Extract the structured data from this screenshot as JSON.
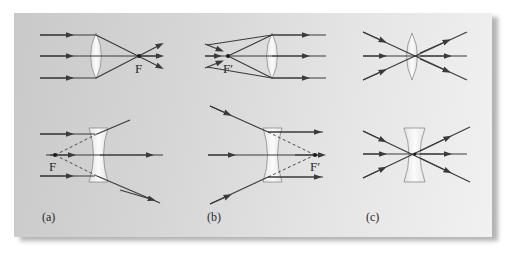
{
  "figure": {
    "colors": {
      "ray": "#3a3a3a",
      "lens_fill": "#f4f4f4",
      "lens_stroke": "#8a8a8a",
      "background_left": "#c9c9c9",
      "background_right": "#f1f1f1"
    },
    "panels": [
      {
        "id": "a",
        "label": "(a)",
        "top": {
          "lens": "convex",
          "focal_label": "F",
          "description": "Parallel rays converge at focal point F"
        },
        "bottom": {
          "lens": "concave",
          "focal_label": "F",
          "description": "Parallel rays diverge as if from focal point F (dashed extensions)"
        }
      },
      {
        "id": "b",
        "label": "(b)",
        "top": {
          "lens": "convex",
          "focal_label": "F′",
          "description": "Rays through focal point F′ emerge parallel"
        },
        "bottom": {
          "lens": "concave",
          "focal_label": "F′",
          "description": "Rays aimed at F′ emerge parallel"
        }
      },
      {
        "id": "c",
        "label": "(c)",
        "top": {
          "lens": "convex",
          "focal_label": "",
          "description": "Rays through lens center pass undeviated"
        },
        "bottom": {
          "lens": "concave",
          "focal_label": "",
          "description": "Rays through lens center pass undeviated"
        }
      }
    ]
  }
}
